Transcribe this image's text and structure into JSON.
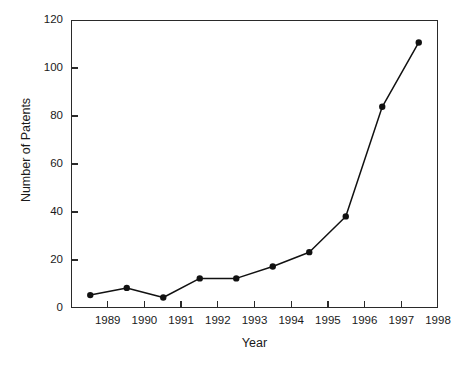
{
  "chart_data": {
    "type": "line",
    "title": "",
    "xlabel": "Year",
    "ylabel": "Number of Patents",
    "xlim": [
      1988,
      1998
    ],
    "ylim": [
      0,
      120
    ],
    "grid": false,
    "legend": null,
    "x": [
      1988.5,
      1989.5,
      1990.5,
      1991.5,
      1992.5,
      1993.5,
      1994.5,
      1995.5,
      1996.5,
      1997.5
    ],
    "values": [
      5,
      8,
      4,
      12,
      12,
      17,
      23,
      38,
      84,
      111
    ],
    "series": [
      {
        "name": "Number of Patents",
        "values": [
          5,
          8,
          4,
          12,
          12,
          17,
          23,
          38,
          84,
          111
        ]
      }
    ],
    "xticks": [
      1989,
      1990,
      1991,
      1992,
      1993,
      1994,
      1995,
      1996,
      1997,
      1998
    ],
    "xtick_labels": [
      "1989",
      "1990",
      "1991",
      "1992",
      "1993",
      "1994",
      "1995",
      "1996",
      "1997",
      "1998"
    ],
    "yticks": [
      0,
      20,
      40,
      60,
      80,
      100,
      120
    ],
    "ytick_labels": [
      "0",
      "20",
      "40",
      "60",
      "80",
      "100",
      "120"
    ],
    "marker": "filled-circle",
    "line_color": "#111111",
    "marker_color": "#111111",
    "background_color": "#ffffff"
  }
}
